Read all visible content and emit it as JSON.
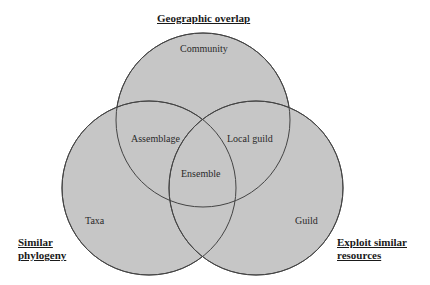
{
  "title": "Geographic overlap",
  "sets": {
    "top": {
      "title": "Geographic overlap",
      "region_label": "Community"
    },
    "left": {
      "title_line1": "Similar",
      "title_line2": "phylogeny",
      "region_label": "Taxa"
    },
    "right": {
      "title_line1": "Exploit similar",
      "title_line2": "resources",
      "region_label": "Guild"
    }
  },
  "intersections": {
    "top_left": "Assemblage",
    "top_right": "Local guild",
    "all": "Ensemble"
  },
  "colors": {
    "fill": "#c6c6c6",
    "stroke": "#444444"
  }
}
